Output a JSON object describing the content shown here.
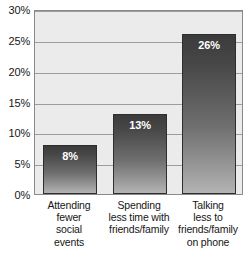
{
  "chart_data": {
    "type": "bar",
    "title": "",
    "subtitle": "",
    "xlabel": "",
    "ylabel": "",
    "ylim": [
      0,
      30
    ],
    "grid": true,
    "legend": "none",
    "y_ticks": [
      "0%",
      "5%",
      "10%",
      "15%",
      "20%",
      "25%",
      "30%"
    ],
    "y_tick_values": [
      0,
      5,
      10,
      15,
      20,
      25,
      30
    ],
    "categories": [
      "Attending fewer social events",
      "Spending less time with friends/family",
      "Talking less to friends/family on phone"
    ],
    "category_lines": [
      [
        "Attending",
        "fewer",
        "social",
        "events"
      ],
      [
        "Spending",
        "less time with",
        "friends/family"
      ],
      [
        "Talking",
        "less to",
        "friends/family",
        "on phone"
      ]
    ],
    "values": [
      8,
      13,
      26
    ],
    "value_labels": [
      "8%",
      "13%",
      "26%"
    ]
  },
  "style": {
    "plot_background": "#ebebeb",
    "gridline_color": "#9d9d9d",
    "axis_color": "#8a8a8a",
    "bar_top_color": "#3b3b3b",
    "bar_bottom_color": "#b4b4b4",
    "value_label_color": "#ffffff",
    "text_color": "#161616"
  }
}
